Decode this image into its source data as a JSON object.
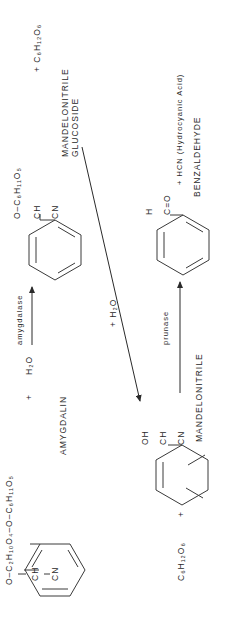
{
  "compounds": {
    "amygdalin": {
      "name": "AMYGDALIN",
      "substituent_top": "O–C₂H₁₀O₄–O–C₆H₁₁O₅",
      "substituent_mid": "CH",
      "substituent_bottom": "CN"
    },
    "mandelonitrile_glucoside": {
      "name_line1": "MANDELONITRILE",
      "name_line2": "GLUCOSIDE",
      "substituent_top": "O–C₆H₁₁O₅",
      "substituent_mid": "CH",
      "substituent_bottom": "CN"
    },
    "mandelonitrile": {
      "name": "MANDELONITRILE",
      "substituent_top": "OH",
      "substituent_mid": "CH",
      "substituent_bottom": "CN"
    },
    "benzaldehyde": {
      "name": "BENZALDEHYDE",
      "substituent_top": "H",
      "substituent_mid": "C=O"
    }
  },
  "reactions": {
    "step1": {
      "reagent_plus": "+",
      "reagent": "H₂O",
      "enzyme": "amygdalase",
      "byproduct": "+ C₆H₁₂O₆"
    },
    "step2": {
      "reagent": "+ H₂O"
    },
    "step3": {
      "byproduct_left": "C₆H₁₂O₆",
      "plus": "+",
      "enzyme": "prunase",
      "byproduct": "+ HCN (Hydrocyanic Acid)"
    }
  }
}
